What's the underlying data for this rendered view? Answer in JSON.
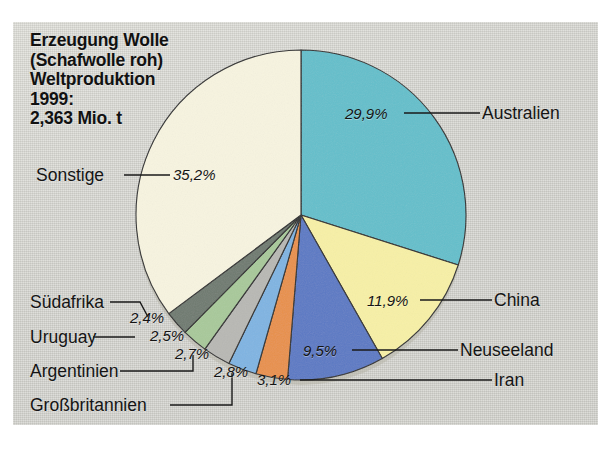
{
  "title": {
    "text": "Erzeugung Wolle\n(Schafwolle roh)\nWeltproduktion\n1999:\n2,363 Mio. t"
  },
  "footer": {
    "text": ""
  },
  "chart_data": {
    "type": "pie",
    "title": "Erzeugung Wolle (Schafwolle roh) Weltproduktion 1999: 2,363 Mio. t",
    "unit": "%",
    "total_label": "2,363 Mio. t",
    "year": "1999",
    "legend": "labels-with-leader-lines",
    "start_angle_deg": 0,
    "direction": "clockwise",
    "labels": [
      "Australien",
      "China",
      "Neuseeland",
      "Iran",
      "Großbritannien",
      "Argentinien",
      "Uruguay",
      "Südafrika",
      "Sonstige"
    ],
    "values": [
      29.9,
      11.9,
      9.5,
      3.1,
      2.8,
      2.7,
      2.5,
      2.4,
      35.2
    ],
    "value_labels": [
      "29,9%",
      "11,9%",
      "9,5%",
      "3,1%",
      "2,8%",
      "2,7%",
      "2,5%",
      "2,4%",
      "35,2%"
    ],
    "colors": [
      "#63bfcb",
      "#f7f0a6",
      "#5b79c4",
      "#e8904a",
      "#7fb4e2",
      "#b8b8b4",
      "#a8c99a",
      "#6f7a70",
      "#f7f4e0"
    ],
    "slices": [
      {
        "name": "Australien",
        "value": 29.9,
        "value_label": "29,9%",
        "color": "#63bfcb"
      },
      {
        "name": "China",
        "value": 11.9,
        "value_label": "11,9%",
        "color": "#f7f0a6"
      },
      {
        "name": "Neuseeland",
        "value": 9.5,
        "value_label": "9,5%",
        "color": "#5b79c4"
      },
      {
        "name": "Iran",
        "value": 3.1,
        "value_label": "3,1%",
        "color": "#e8904a"
      },
      {
        "name": "Großbritannien",
        "value": 2.8,
        "value_label": "2,8%",
        "color": "#7fb4e2"
      },
      {
        "name": "Argentinien",
        "value": 2.7,
        "value_label": "2,7%",
        "color": "#b8b8b4"
      },
      {
        "name": "Uruguay",
        "value": 2.5,
        "value_label": "2,5%",
        "color": "#a8c99a"
      },
      {
        "name": "Südafrika",
        "value": 2.4,
        "value_label": "2,4%",
        "color": "#6f7a70"
      },
      {
        "name": "Sonstige",
        "value": 35.2,
        "value_label": "35,2%",
        "color": "#f7f4e0"
      }
    ]
  },
  "labels": {
    "australien": "Australien",
    "china": "China",
    "neuseeland": "Neuseeland",
    "iran": "Iran",
    "grossbritannien": "Großbritannien",
    "argentinien": "Argentinien",
    "uruguay": "Uruguay",
    "suedafrika": "Südafrika",
    "sonstige": "Sonstige"
  },
  "percents": {
    "australien": "29,9%",
    "china": "11,9%",
    "neuseeland": "9,5%",
    "iran": "3,1%",
    "grossbritannien": "2,8%",
    "argentinien": "2,7%",
    "uruguay": "2,5%",
    "suedafrika": "2,4%",
    "sonstige": "35,2%"
  }
}
